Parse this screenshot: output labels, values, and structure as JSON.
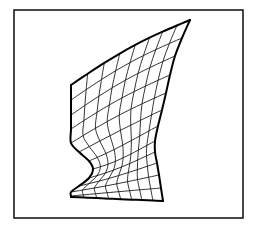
{
  "figure": {
    "kind": "line-art technical illustration",
    "background_color": "#ffffff",
    "line_color": "#111111",
    "outline_color": "#000000",
    "frame_color": "#1a1a1a",
    "canvas": {
      "width": 258,
      "height": 230
    }
  },
  "frame": {
    "x": 14,
    "y": 10,
    "width": 229,
    "height": 208,
    "stroke_width": 1.6
  },
  "mesh": {
    "rows": 13,
    "columns": 9,
    "line_width": 0.85,
    "outline_width": 2.0,
    "description": "curved quadrilateral wireframe surface patch with concave left notch, narrow waist and tapering upper-right spike",
    "left_edge": [
      [
        71,
        85
      ],
      [
        71,
        100
      ],
      [
        71,
        115
      ],
      [
        71,
        129
      ],
      [
        71,
        143
      ],
      [
        79,
        152
      ],
      [
        89,
        161
      ],
      [
        93,
        169
      ],
      [
        89,
        178
      ],
      [
        79,
        186
      ],
      [
        71,
        192
      ],
      [
        71,
        196
      ],
      [
        71,
        197
      ]
    ],
    "right_edge": [
      [
        190,
        20
      ],
      [
        182,
        38
      ],
      [
        175,
        56
      ],
      [
        170,
        75
      ],
      [
        166,
        93
      ],
      [
        162,
        110
      ],
      [
        158,
        126
      ],
      [
        155,
        141
      ],
      [
        155,
        152
      ],
      [
        157,
        163
      ],
      [
        159,
        175
      ],
      [
        161,
        188
      ],
      [
        163,
        201
      ]
    ],
    "top_edge": [
      [
        71,
        85
      ],
      [
        85,
        79
      ],
      [
        100,
        72
      ],
      [
        116,
        63
      ],
      [
        132,
        52
      ],
      [
        148,
        42
      ],
      [
        162,
        33
      ],
      [
        176,
        26
      ],
      [
        190,
        20
      ]
    ],
    "bottom_edge": [
      [
        71,
        197
      ],
      [
        82,
        198
      ],
      [
        93,
        198
      ],
      [
        104,
        199
      ],
      [
        115,
        199
      ],
      [
        127,
        200
      ],
      [
        139,
        200
      ],
      [
        151,
        201
      ],
      [
        163,
        201
      ]
    ],
    "row_profiles": [
      {
        "t": 0.0,
        "left": [
          71,
          85
        ],
        "right": [
          190,
          20
        ],
        "bow": -5
      },
      {
        "t": 0.09,
        "left": [
          71,
          100
        ],
        "right": [
          182,
          38
        ],
        "bow": -4
      },
      {
        "t": 0.18,
        "left": [
          71,
          115
        ],
        "right": [
          175,
          56
        ],
        "bow": -3
      },
      {
        "t": 0.27,
        "left": [
          71,
          129
        ],
        "right": [
          170,
          75
        ],
        "bow": -2
      },
      {
        "t": 0.36,
        "left": [
          71,
          143
        ],
        "right": [
          166,
          93
        ],
        "bow": -1
      },
      {
        "t": 0.45,
        "left": [
          79,
          152
        ],
        "right": [
          162,
          110
        ],
        "bow": 1
      },
      {
        "t": 0.55,
        "left": [
          89,
          161
        ],
        "right": [
          158,
          126
        ],
        "bow": 3
      },
      {
        "t": 0.63,
        "left": [
          93,
          169
        ],
        "right": [
          155,
          141
        ],
        "bow": 4
      },
      {
        "t": 0.72,
        "left": [
          89,
          178
        ],
        "right": [
          155,
          152
        ],
        "bow": 3
      },
      {
        "t": 0.81,
        "left": [
          79,
          186
        ],
        "right": [
          157,
          163
        ],
        "bow": 2
      },
      {
        "t": 0.88,
        "left": [
          71,
          192
        ],
        "right": [
          159,
          175
        ],
        "bow": 1
      },
      {
        "t": 0.94,
        "left": [
          71,
          196
        ],
        "right": [
          161,
          188
        ],
        "bow": 0
      },
      {
        "t": 1.0,
        "left": [
          71,
          197
        ],
        "right": [
          163,
          201
        ],
        "bow": 0
      }
    ],
    "column_fractions": [
      0.0,
      0.14,
      0.28,
      0.41,
      0.54,
      0.66,
      0.77,
      0.89,
      1.0
    ],
    "column_sag": [
      0,
      4,
      7,
      9,
      10,
      9,
      7,
      4,
      0
    ]
  }
}
